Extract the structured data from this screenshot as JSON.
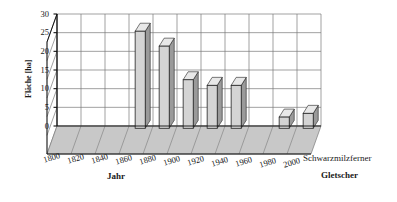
{
  "chart_data": {
    "type": "bar",
    "title": "",
    "subtitle": "",
    "xlabel": "Jahr",
    "ylabel": "Fläche [ha]",
    "zlabel": "Gletscher",
    "categories": [
      "1800",
      "1820",
      "1840",
      "1860",
      "1880",
      "1900",
      "1920",
      "1940",
      "1960",
      "1980",
      "2000"
    ],
    "series": [
      {
        "name": "Schwarzmilzferner",
        "values": [
          0,
          0,
          0,
          26,
          22,
          13,
          11.5,
          11.5,
          0,
          3,
          4
        ]
      }
    ],
    "yticks": [
      "0",
      "5",
      "10",
      "15",
      "20",
      "25",
      "30"
    ],
    "ytick_values": [
      0,
      5,
      10,
      15,
      20,
      25,
      30
    ],
    "ylim": [
      0,
      30
    ],
    "grid": true,
    "legend_position": "right",
    "projection": "3d"
  },
  "axes": {
    "y_title": "Fläche [ha]",
    "x_title": "Jahr",
    "z_title": "Gletscher",
    "series_label": "Schwarzmilzferner"
  },
  "colors": {
    "bar_front": "#d4d4d4",
    "bar_side": "#9a9a9a",
    "bar_top": "#e8e8e8",
    "grid": "#7a7a7a",
    "floor": "#c8c8c8",
    "axis": "#111111",
    "background": "#ffffff",
    "text": "#1a1a1a"
  }
}
